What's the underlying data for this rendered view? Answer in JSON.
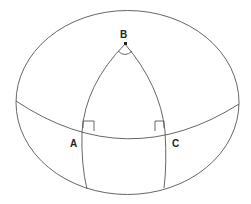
{
  "diagram": {
    "type": "spherical-triangle",
    "vertices": {
      "apex": {
        "label": "B",
        "angle_marker": "arc"
      },
      "left": {
        "label": "A",
        "angle_marker": "right-angle"
      },
      "right": {
        "label": "C",
        "angle_marker": "right-angle"
      }
    },
    "colors": {
      "stroke": "#555555",
      "label": "#222222",
      "background": "#ffffff"
    }
  }
}
